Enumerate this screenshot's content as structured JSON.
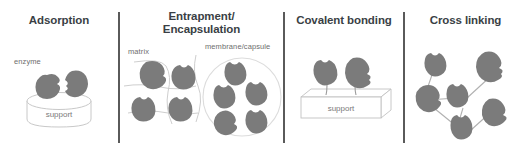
{
  "figure": {
    "title_color": "#3a3f45",
    "label_color": "#6e6e6e",
    "enzyme_fill": "#7b7b7b",
    "outline_color": "#b9b9b9",
    "divider_color": "#5a5a5a",
    "background": "#ffffff",
    "panel_count": 4
  },
  "panels": [
    {
      "id": "adsorption",
      "title": "Adsorption",
      "labels": {
        "enzyme": "enzyme",
        "support": "support"
      },
      "enzyme_count": 2,
      "support_shape": "cylinder"
    },
    {
      "id": "entrapment-encapsulation",
      "title_line1": "Entrapment/",
      "title_line2": "Encapsulation",
      "labels": {
        "matrix": "matrix",
        "membrane": "membrane/capsule"
      },
      "matrix_enzyme_count": 4,
      "capsule_enzyme_count": 5
    },
    {
      "id": "covalent-bonding",
      "title": "Covalent bonding",
      "labels": {
        "support": "support"
      },
      "enzyme_count": 2,
      "support_shape": "slab"
    },
    {
      "id": "cross-linking",
      "title": "Cross linking",
      "enzyme_count": 6,
      "link_count": 6
    }
  ],
  "dividers": [
    {
      "x": 118
    },
    {
      "x": 283
    },
    {
      "x": 403
    }
  ]
}
